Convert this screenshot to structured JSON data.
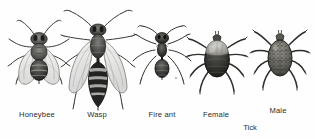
{
  "figure": {
    "name": "stinging-and-biting-insects-plate",
    "background_color": "#fefefe",
    "ink_color": "#2b2b2b",
    "specimens": [
      {
        "id": "honeybee",
        "label": "Honeybee",
        "label_x": 37,
        "label_y": 110,
        "kind": "bee"
      },
      {
        "id": "wasp",
        "label": "Wasp",
        "label_x": 97,
        "label_y": 110,
        "kind": "wasp"
      },
      {
        "id": "fire-ant",
        "label": "Fire ant",
        "label_x": 162,
        "label_y": 110,
        "kind": "ant"
      },
      {
        "id": "tick-female",
        "label": "Female",
        "label_x": 216,
        "label_y": 110,
        "kind": "tick-female"
      },
      {
        "id": "tick-male",
        "label": "Male",
        "label_x": 278,
        "label_y": 106,
        "kind": "tick-male"
      }
    ],
    "group_labels": [
      {
        "id": "tick-group",
        "text": "Tick",
        "x": 250,
        "y": 123
      }
    ]
  }
}
